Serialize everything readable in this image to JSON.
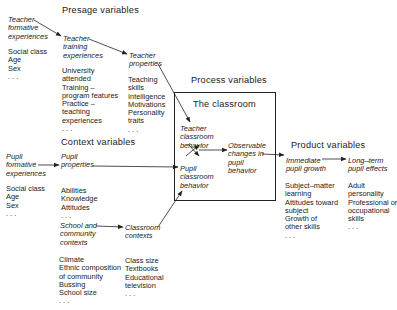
{
  "headings": {
    "presage": "Presage variables",
    "context": "Context variables",
    "process": "Process variables",
    "classroom": "The classroom",
    "product": "Product variables"
  },
  "nodes": {
    "teacher_formative": {
      "label": [
        "Teacher",
        "formative",
        "experiences"
      ],
      "items": [
        "Social class",
        "Age",
        "Sex",
        ". . ."
      ]
    },
    "teacher_training": {
      "label": [
        "Teacher",
        "training",
        "experiences"
      ],
      "items": [
        "University",
        "attended",
        "Training –",
        "program features",
        "Practice –",
        "teaching",
        "experiences",
        ". . ."
      ]
    },
    "teacher_properties": {
      "label": [
        "Teacher",
        "properties"
      ],
      "items": [
        "Teaching",
        "skills",
        "Intelligence",
        "Motivations",
        "Personality",
        "traits",
        ". . ."
      ]
    },
    "pupil_formative": {
      "label": [
        "Pupil",
        "formative",
        "experiences"
      ],
      "items": [
        "Social class",
        "Age",
        "Sex",
        ". . ."
      ]
    },
    "pupil_properties": {
      "label": [
        "Pupil",
        "properties"
      ],
      "items": [
        "Abilities",
        "Knowledge",
        "Attitudes",
        ". . ."
      ]
    },
    "school_community": {
      "label": [
        "School and",
        "community",
        "contexts"
      ],
      "items": [
        "Climate",
        "Ethnic composition",
        "of community",
        "Bussing",
        "School size",
        ". . ."
      ]
    },
    "classroom_contexts": {
      "label": [
        "Classroom",
        "contexts"
      ],
      "items": [
        "Class size",
        "Textbooks",
        "Educational",
        "television",
        ". . ."
      ]
    },
    "teacher_classroom_behavior": {
      "label": [
        "Teacher",
        "classroom",
        "behavior"
      ]
    },
    "pupil_classroom_behavior": {
      "label": [
        "Pupil",
        "classroom",
        "behavior"
      ]
    },
    "observable_changes": {
      "label": [
        "Observable",
        "changes in",
        "pupil",
        "behavior"
      ]
    },
    "immediate_growth": {
      "label": [
        "Immediate",
        "pupil growth"
      ],
      "items": [
        "Subject–matter",
        "learning",
        "Attitudes toward",
        "subject",
        "Growth of",
        "other skills",
        ". . ."
      ]
    },
    "long_term_effects": {
      "label": [
        "Long–term",
        "pupil effects"
      ],
      "items": [
        "Adult",
        "personality",
        "Professional or",
        "occupational",
        "skills",
        ". . ."
      ]
    }
  },
  "colors": {
    "ink": "#1a1a1a",
    "background": "#ffffff"
  }
}
